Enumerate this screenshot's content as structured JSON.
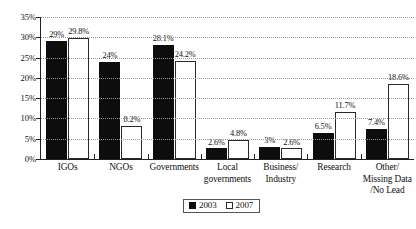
{
  "chart_data": {
    "type": "bar",
    "title": "",
    "subtitle": "",
    "xlabel": "",
    "ylabel": "",
    "ylim": [
      0,
      35
    ],
    "ytick_labels": [
      "0%",
      "5%",
      "10%",
      "15%",
      "20%",
      "25%",
      "30%",
      "35%"
    ],
    "ytick_values": [
      0,
      5,
      10,
      15,
      20,
      25,
      30,
      35
    ],
    "grid": true,
    "grid_style": "dotted-horizontal",
    "legend_position": "bottom-center",
    "categories": [
      "IGOs",
      "NGOs",
      "Governments",
      "Local governments",
      "Business/ Industry",
      "Research",
      "Other/ Missing Data /No Lead"
    ],
    "category_lines": [
      [
        "IGOs"
      ],
      [
        "NGOs"
      ],
      [
        "Governments"
      ],
      [
        "Local",
        "governments"
      ],
      [
        "Business/",
        "Industry"
      ],
      [
        "Research"
      ],
      [
        "Other/",
        "Missing Data",
        "/No Lead"
      ]
    ],
    "series": [
      {
        "name": "2003",
        "color": "#0d0d0d",
        "values": [
          29,
          24,
          28.1,
          2.6,
          3,
          6.5,
          7.4
        ],
        "value_labels": [
          "29%",
          "24%",
          "28.1%",
          "2.6%",
          "3%",
          "6.5%",
          "7.4%"
        ]
      },
      {
        "name": "2007",
        "color": "#ffffff",
        "values": [
          29.8,
          8.2,
          24.2,
          4.8,
          2.6,
          11.7,
          18.6
        ],
        "value_labels": [
          "29.8%",
          "8.2%",
          "24.2%",
          "4.8%",
          "2.6%",
          "11.7%",
          "18.6%"
        ]
      }
    ]
  },
  "legend": {
    "items": [
      {
        "label": "2003",
        "swatch": "filled-black-square"
      },
      {
        "label": "2007",
        "swatch": "outline-white-square"
      }
    ]
  }
}
